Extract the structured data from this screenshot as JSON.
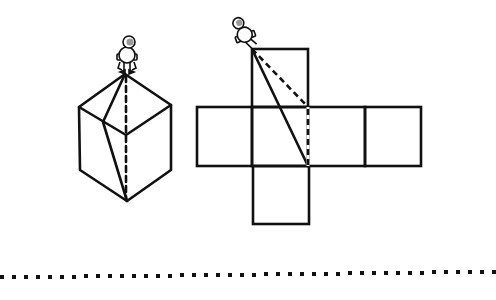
{
  "diagram": {
    "description": "Astronaut standing on a cube vertex; cube shown in 3D and as an unfolded net with shortest path drawn",
    "colors": {
      "stroke": "#111111",
      "background": "#ffffff",
      "helmet_visor": "#9a9a9a"
    },
    "cube": {
      "vertices": {
        "top": [
          125,
          74
        ],
        "upper_left": [
          79,
          107
        ],
        "upper_right": [
          171,
          105
        ],
        "center": [
          126,
          135
        ],
        "lower_left": [
          80,
          170
        ],
        "lower_right": [
          171,
          170
        ],
        "bottom": [
          127,
          201
        ],
        "crease_point": [
          103,
          122
        ]
      },
      "solid_path": "top -> crease_point -> bottom",
      "dashed_path": "top -> bottom (hidden straight)"
    },
    "net": {
      "layout": "cross",
      "cells": [
        {
          "name": "top",
          "x": 252,
          "y": 49,
          "w": 56,
          "h": 58
        },
        {
          "name": "left",
          "x": 197,
          "y": 107,
          "w": 55,
          "h": 59
        },
        {
          "name": "front",
          "x": 252,
          "y": 107,
          "w": 56,
          "h": 59
        },
        {
          "name": "right",
          "x": 308,
          "y": 107,
          "w": 57,
          "h": 59
        },
        {
          "name": "back",
          "x": 365,
          "y": 107,
          "w": 56,
          "h": 59
        },
        {
          "name": "bottom",
          "x": 253,
          "y": 166,
          "w": 56,
          "h": 58
        }
      ],
      "solid_line": [
        [
          252,
          49
        ],
        [
          308,
          166
        ]
      ],
      "dashed_lines": [
        [
          [
            252,
            49
          ],
          [
            308,
            107
          ]
        ],
        [
          [
            308,
            107
          ],
          [
            308,
            166
          ]
        ]
      ]
    },
    "figures": [
      {
        "name": "astronaut-on-cube",
        "x": 127,
        "y": 48,
        "tilt": 0
      },
      {
        "name": "astronaut-on-net",
        "x": 243,
        "y": 30,
        "tilt": -20
      }
    ],
    "separator": {
      "style": "dotted",
      "y_left": 277,
      "y_right": 271,
      "dot_size": 4,
      "pitch": 12
    }
  }
}
